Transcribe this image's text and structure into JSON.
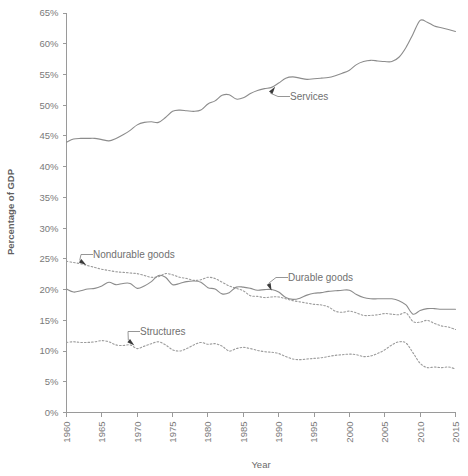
{
  "chart_data": {
    "type": "line",
    "title": "",
    "xlabel": "Year",
    "ylabel": "Percentage of GDP",
    "xlim": [
      1960,
      2015
    ],
    "ylim": [
      0,
      65
    ],
    "grid": false,
    "legend_position": "inline-annotations",
    "x_ticks": [
      "1960",
      "1965",
      "1970",
      "1975",
      "1980",
      "1985",
      "1990",
      "1995",
      "2000",
      "2005",
      "2010",
      "2015"
    ],
    "y_ticks": [
      "0%",
      "5%",
      "10%",
      "15%",
      "20%",
      "25%",
      "30%",
      "35%",
      "40%",
      "45%",
      "50%",
      "55%",
      "60%",
      "65%"
    ],
    "x": [
      1960,
      1961,
      1962,
      1963,
      1964,
      1965,
      1966,
      1967,
      1968,
      1969,
      1970,
      1971,
      1972,
      1973,
      1974,
      1975,
      1976,
      1977,
      1978,
      1979,
      1980,
      1981,
      1982,
      1983,
      1984,
      1985,
      1986,
      1987,
      1988,
      1989,
      1990,
      1991,
      1992,
      1993,
      1994,
      1995,
      1996,
      1997,
      1998,
      1999,
      2000,
      2001,
      2002,
      2003,
      2004,
      2005,
      2006,
      2007,
      2008,
      2009,
      2010,
      2011,
      2012,
      2013,
      2014,
      2015
    ],
    "series": [
      {
        "name": "Services",
        "style": "solid",
        "values": [
          44.0,
          44.5,
          44.6,
          44.6,
          44.6,
          44.4,
          44.2,
          44.6,
          45.2,
          45.9,
          46.8,
          47.2,
          47.3,
          47.2,
          48.0,
          49.0,
          49.2,
          49.1,
          49.0,
          49.2,
          50.2,
          50.7,
          51.6,
          51.7,
          51.0,
          51.2,
          51.9,
          52.4,
          52.7,
          52.9,
          53.6,
          54.4,
          54.6,
          54.4,
          54.2,
          54.3,
          54.4,
          54.5,
          54.8,
          55.2,
          55.7,
          56.6,
          57.1,
          57.3,
          57.2,
          57.1,
          57.1,
          57.8,
          59.4,
          61.6,
          63.8,
          63.5,
          62.9,
          62.6,
          62.3,
          62.0
        ]
      },
      {
        "name": "Nondurable goods",
        "style": "dotted",
        "values": [
          24.6,
          24.4,
          24.2,
          23.9,
          23.6,
          23.3,
          23.1,
          22.9,
          22.8,
          22.7,
          22.6,
          22.3,
          22.0,
          22.1,
          22.6,
          22.4,
          22.0,
          21.8,
          21.5,
          21.6,
          22.0,
          21.8,
          21.2,
          20.6,
          20.2,
          19.8,
          19.0,
          18.9,
          18.7,
          18.8,
          18.8,
          18.5,
          18.2,
          18.0,
          17.8,
          17.6,
          17.5,
          17.2,
          16.5,
          16.3,
          16.5,
          16.2,
          15.8,
          15.8,
          15.9,
          16.1,
          16.0,
          15.9,
          16.2,
          14.8,
          14.7,
          15.0,
          14.5,
          14.1,
          13.9,
          13.5
        ]
      },
      {
        "name": "Durable goods",
        "style": "solid",
        "values": [
          20.1,
          19.6,
          19.8,
          20.1,
          20.2,
          20.6,
          21.2,
          20.8,
          21.0,
          21.0,
          20.2,
          20.6,
          21.3,
          22.3,
          22.0,
          20.8,
          21.0,
          21.3,
          21.4,
          21.2,
          20.3,
          20.1,
          19.3,
          19.5,
          20.4,
          20.4,
          20.2,
          19.9,
          20.0,
          20.0,
          19.6,
          18.7,
          18.4,
          18.6,
          19.1,
          19.4,
          19.5,
          19.7,
          19.8,
          19.9,
          19.9,
          19.2,
          18.7,
          18.5,
          18.5,
          18.5,
          18.5,
          18.2,
          17.5,
          16.0,
          16.6,
          16.9,
          16.9,
          16.8,
          16.8,
          16.8
        ]
      },
      {
        "name": "Structures",
        "style": "dotted",
        "values": [
          11.4,
          11.5,
          11.4,
          11.4,
          11.5,
          11.7,
          11.5,
          11.0,
          10.9,
          11.0,
          10.4,
          10.8,
          11.2,
          11.5,
          11.0,
          10.2,
          10.0,
          10.4,
          11.0,
          11.4,
          11.1,
          11.2,
          10.8,
          10.0,
          10.4,
          10.6,
          10.4,
          10.1,
          9.9,
          9.8,
          9.6,
          9.1,
          8.7,
          8.6,
          8.7,
          8.8,
          8.9,
          9.1,
          9.3,
          9.4,
          9.5,
          9.4,
          9.1,
          9.2,
          9.6,
          10.2,
          11.0,
          11.5,
          11.3,
          9.7,
          8.0,
          7.3,
          7.4,
          7.3,
          7.4,
          7.1
        ]
      }
    ],
    "annotations": [
      {
        "name": "services",
        "label": "Services",
        "target_year": 1989.5,
        "target_value": 53.0,
        "text_x": 290,
        "text_y": 100
      },
      {
        "name": "nondurable-goods",
        "label": "Nondurable goods",
        "target_year": 1962.8,
        "target_value": 24.0,
        "text_x": 93,
        "text_y": 258
      },
      {
        "name": "durable-goods",
        "label": "Durable goods",
        "target_year": 1989.0,
        "target_value": 19.8,
        "text_x": 288,
        "text_y": 281
      },
      {
        "name": "structures",
        "label": "Structures",
        "target_year": 1969.6,
        "target_value": 10.9,
        "text_x": 140,
        "text_y": 335
      }
    ],
    "colors": {
      "line": "#8c8c8c",
      "dotted_line": "#9c9c9c",
      "axis": "#9a9a9a",
      "text": "#6d6d6d",
      "background": "#ffffff"
    }
  }
}
